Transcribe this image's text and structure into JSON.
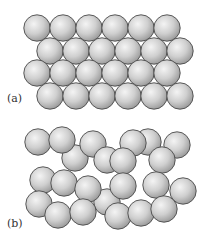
{
  "figure": {
    "colors": {
      "background": "#ffffff",
      "sphere_highlight": "#f4f4f4",
      "sphere_mid": "#cfcfcf",
      "sphere_edge": "#9a9a9a",
      "sphere_outline": "#4a4a4a",
      "label": "#333333"
    },
    "sphere_radius": 13.2,
    "panels": [
      {
        "id": "a",
        "label": "(a)",
        "label_pos": {
          "x": 7,
          "y": 93
        },
        "description": "ordered close-packed arrangement",
        "spheres": [
          {
            "x": 37,
            "y": 28
          },
          {
            "x": 63,
            "y": 28
          },
          {
            "x": 89,
            "y": 28
          },
          {
            "x": 115,
            "y": 28
          },
          {
            "x": 141,
            "y": 28
          },
          {
            "x": 167,
            "y": 28
          },
          {
            "x": 50,
            "y": 51
          },
          {
            "x": 76,
            "y": 51
          },
          {
            "x": 102,
            "y": 51
          },
          {
            "x": 128,
            "y": 51
          },
          {
            "x": 154,
            "y": 51
          },
          {
            "x": 180,
            "y": 51
          },
          {
            "x": 37,
            "y": 73
          },
          {
            "x": 63,
            "y": 73
          },
          {
            "x": 89,
            "y": 73
          },
          {
            "x": 115,
            "y": 73
          },
          {
            "x": 141,
            "y": 73
          },
          {
            "x": 167,
            "y": 73
          },
          {
            "x": 50,
            "y": 96
          },
          {
            "x": 76,
            "y": 96
          },
          {
            "x": 102,
            "y": 96
          },
          {
            "x": 128,
            "y": 96
          },
          {
            "x": 154,
            "y": 96
          },
          {
            "x": 180,
            "y": 96
          }
        ]
      },
      {
        "id": "b",
        "label": "(b)",
        "label_pos": {
          "x": 7,
          "y": 218
        },
        "description": "disordered random arrangement",
        "spheres": [
          {
            "x": 75,
            "y": 158
          },
          {
            "x": 38,
            "y": 142
          },
          {
            "x": 62,
            "y": 140
          },
          {
            "x": 93,
            "y": 144
          },
          {
            "x": 148,
            "y": 142
          },
          {
            "x": 133,
            "y": 143
          },
          {
            "x": 107,
            "y": 160
          },
          {
            "x": 123,
            "y": 161
          },
          {
            "x": 177,
            "y": 145
          },
          {
            "x": 162,
            "y": 160
          },
          {
            "x": 107,
            "y": 202
          },
          {
            "x": 43,
            "y": 180
          },
          {
            "x": 64,
            "y": 183
          },
          {
            "x": 88,
            "y": 189
          },
          {
            "x": 123,
            "y": 186
          },
          {
            "x": 156,
            "y": 185
          },
          {
            "x": 183,
            "y": 191
          },
          {
            "x": 39,
            "y": 204
          },
          {
            "x": 58,
            "y": 215
          },
          {
            "x": 83,
            "y": 212
          },
          {
            "x": 118,
            "y": 216
          },
          {
            "x": 141,
            "y": 213
          },
          {
            "x": 164,
            "y": 209
          }
        ]
      }
    ]
  }
}
